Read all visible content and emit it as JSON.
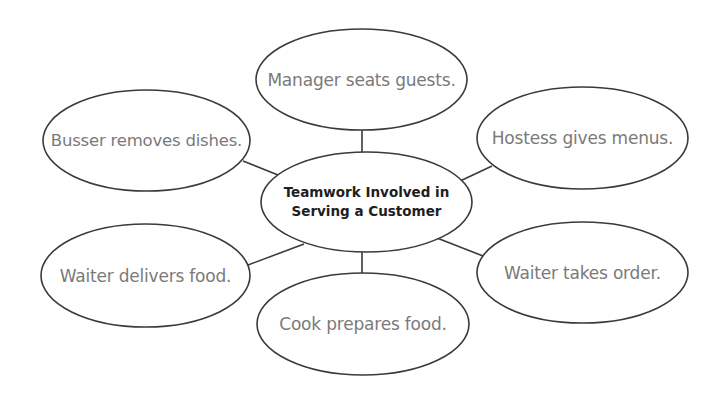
{
  "diagram": {
    "type": "concept-web",
    "center": {
      "line1": "Teamwork Involved in",
      "line2": "Serving a Customer"
    },
    "nodes": [
      {
        "id": "manager",
        "label": "Manager seats guests."
      },
      {
        "id": "hostess",
        "label": "Hostess gives menus."
      },
      {
        "id": "waiter-order",
        "label": "Waiter takes order."
      },
      {
        "id": "cook",
        "label": "Cook prepares food."
      },
      {
        "id": "waiter-deliver",
        "label": "Waiter delivers food."
      },
      {
        "id": "busser",
        "label": "Busser removes dishes."
      }
    ],
    "colors": {
      "outline": "#3a3a3a",
      "outer_text": "#7a7a7a",
      "center_text": "#1e1e1e",
      "background": "#ffffff"
    }
  }
}
